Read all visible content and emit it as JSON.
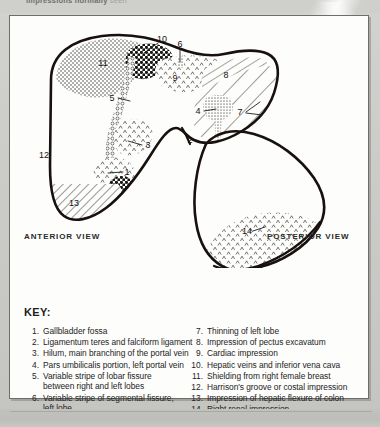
{
  "scan": {
    "top_fragment_bold": "impressions normally",
    "top_fragment_faint": "seen"
  },
  "figure": {
    "anterior_view_label": "ANTERIOR VIEW",
    "posterior_view_label": "POSTERIOR VIEW",
    "callouts": [
      {
        "n": "1",
        "x": 117,
        "y": 155
      },
      {
        "n": "2",
        "x": 180,
        "y": 123
      },
      {
        "n": "3",
        "x": 136,
        "y": 128
      },
      {
        "n": "4",
        "x": 188,
        "y": 94
      },
      {
        "n": "5",
        "x": 102,
        "y": 81
      },
      {
        "n": "6",
        "x": 170,
        "y": 29
      },
      {
        "n": "7",
        "x": 230,
        "y": 95
      },
      {
        "n": "8",
        "x": 216,
        "y": 58
      },
      {
        "n": "9",
        "x": 165,
        "y": 61
      },
      {
        "n": "10",
        "x": 152,
        "y": 24
      },
      {
        "n": "11",
        "x": 93,
        "y": 46
      },
      {
        "n": "12",
        "x": 34,
        "y": 138
      },
      {
        "n": "13",
        "x": 64,
        "y": 186
      },
      {
        "n": "14",
        "x": 237,
        "y": 214
      }
    ]
  },
  "key": {
    "title": "KEY:",
    "left_column": [
      {
        "num": "1.",
        "text": "Gallbladder fossa",
        "cont": ""
      },
      {
        "num": "2.",
        "text": "Ligamentum teres and falciform ligament",
        "cont": ""
      },
      {
        "num": "3.",
        "text": "Hilum, main branching of the portal vein",
        "cont": ""
      },
      {
        "num": "4.",
        "text": "Pars umbilicalis portion, left portal vein",
        "cont": ""
      },
      {
        "num": "5.",
        "text": "Variable stripe of lobar fissure",
        "cont": "between right and left lobes"
      },
      {
        "num": "6.",
        "text": "Variable stripe of segmental fissure,",
        "cont": "left lobe"
      }
    ],
    "right_column": [
      {
        "num": "7.",
        "text": "Thinning of left lobe",
        "cont": ""
      },
      {
        "num": "8.",
        "text": "Impression of pectus excavatum",
        "cont": ""
      },
      {
        "num": "9.",
        "text": "Cardiac impression",
        "cont": ""
      },
      {
        "num": "10.",
        "text": "Hepatic veins and inferior vena cava",
        "cont": ""
      },
      {
        "num": "11.",
        "text": "Shielding from right female breast",
        "cont": ""
      },
      {
        "num": "12.",
        "text": "Harrison's groove or costal impression",
        "cont": ""
      },
      {
        "num": "13.",
        "text": "Impression of hepatic flexure of colon",
        "cont": ""
      },
      {
        "num": "14.",
        "text": "Right renal impression",
        "cont": ""
      }
    ]
  },
  "colors": {
    "page": "#c8c8c6",
    "panel": "#fdfdfc",
    "ink": "#1d1d1c",
    "border": "#6d6d6b"
  }
}
